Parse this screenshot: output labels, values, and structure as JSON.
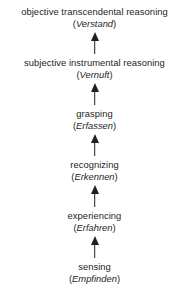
{
  "diagram": {
    "orientation": "bottom-to-top",
    "arrow_direction": "up",
    "text_color": "#231f20",
    "background_color": "#ffffff",
    "levels": [
      {
        "english": "objective transcendental reasoning",
        "german": "Verstand",
        "german_display": "(Verstand)",
        "open_paren": "(",
        "close_paren": ")"
      },
      {
        "english": "subjective instrumental reasoning",
        "german": "Vernuft",
        "german_display": "(Vernuft)",
        "open_paren": "(",
        "close_paren": ")"
      },
      {
        "english": "grasping",
        "german": "Erfassen",
        "german_display": "(Erfassen)",
        "open_paren": "(",
        "close_paren": ")"
      },
      {
        "english": "recognizing",
        "german": "Erkennen",
        "german_display": "(Erkennen)",
        "open_paren": "(",
        "close_paren": ")"
      },
      {
        "english": "experiencing",
        "german": "Erfahren",
        "german_display": "(Erfahren)",
        "open_paren": "(",
        "close_paren": ")"
      },
      {
        "english": "sensing",
        "german": "Empfinden",
        "german_display": "(Empfinden)",
        "open_paren": "(",
        "close_paren": ")"
      }
    ],
    "connectors": [
      {
        "from": "subjective instrumental reasoning",
        "to": "objective transcendental reasoning",
        "icon": "arrow-up-icon"
      },
      {
        "from": "grasping",
        "to": "subjective instrumental reasoning",
        "icon": "arrow-up-icon"
      },
      {
        "from": "recognizing",
        "to": "grasping",
        "icon": "arrow-up-icon"
      },
      {
        "from": "experiencing",
        "to": "recognizing",
        "icon": "arrow-up-icon"
      },
      {
        "from": "sensing",
        "to": "experiencing",
        "icon": "arrow-up-icon"
      }
    ]
  }
}
